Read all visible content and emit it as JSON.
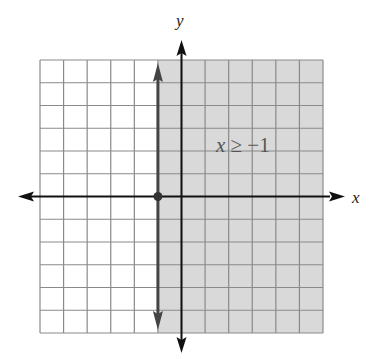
{
  "chart_data": {
    "type": "inequality-graph",
    "title": "",
    "inequality": "x ≥ −1",
    "boundary": {
      "type": "vertical-line",
      "x": -1,
      "style": "solid",
      "included": true
    },
    "shaded_region": "x >= -1 (right of boundary)",
    "marked_point": {
      "x": -1,
      "y": 0
    },
    "xlabel": "x",
    "ylabel": "y",
    "xlim": [
      -6,
      6
    ],
    "ylim": [
      -6,
      6
    ],
    "grid": true,
    "grid_step": 1
  },
  "labels": {
    "x_axis": "x",
    "y_axis": "y",
    "inequality": "x ≥ −1"
  },
  "colors": {
    "shade": "#d9d9d9",
    "grid": "#8a8a8a",
    "axis": "#111111",
    "boundary": "#444444"
  }
}
